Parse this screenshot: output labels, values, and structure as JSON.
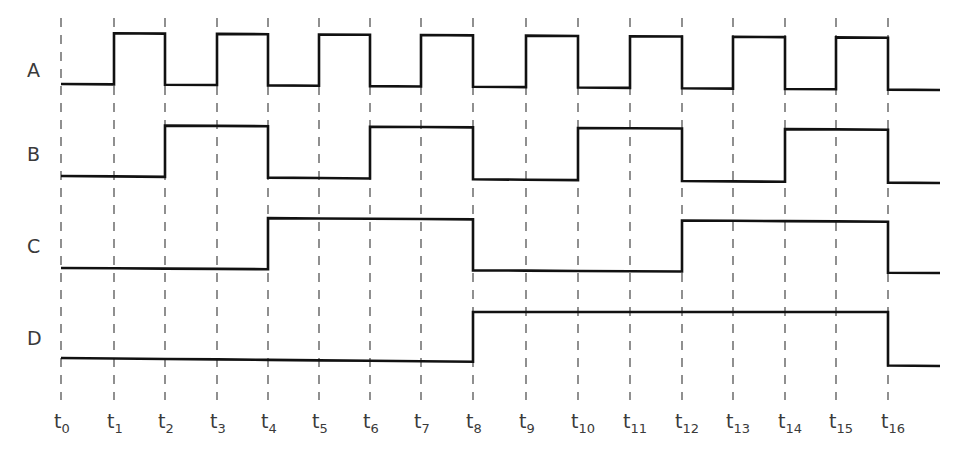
{
  "signals": [
    {
      "name": "A",
      "label_y": 84,
      "high_y": [
        33,
        38
      ],
      "low_y": [
        84,
        90
      ],
      "levels": [
        0,
        1,
        0,
        1,
        0,
        1,
        0,
        1,
        0,
        1,
        0,
        1,
        0,
        1,
        0,
        1,
        0
      ]
    },
    {
      "name": "B",
      "label_y": 168,
      "high_y": [
        125,
        130
      ],
      "low_y": [
        176,
        183
      ],
      "levels": [
        0,
        0,
        1,
        1,
        0,
        0,
        1,
        1,
        0,
        0,
        1,
        1,
        0,
        0,
        1,
        1,
        0
      ]
    },
    {
      "name": "C",
      "label_y": 260,
      "high_y": [
        217,
        222
      ],
      "low_y": [
        268,
        273
      ],
      "levels": [
        0,
        0,
        0,
        0,
        1,
        1,
        1,
        1,
        0,
        0,
        0,
        0,
        1,
        1,
        1,
        1,
        0
      ]
    },
    {
      "name": "D",
      "label_y": 352,
      "high_y": [
        312,
        312
      ],
      "low_y": [
        358,
        366
      ],
      "levels": [
        0,
        0,
        0,
        0,
        0,
        0,
        0,
        0,
        1,
        1,
        1,
        1,
        1,
        1,
        1,
        1,
        0
      ]
    }
  ],
  "time_markers": [
    {
      "base": "t",
      "sub": "0",
      "x": 61
    },
    {
      "base": "t",
      "sub": "1",
      "x": 114
    },
    {
      "base": "t",
      "sub": "2",
      "x": 165
    },
    {
      "base": "t",
      "sub": "3",
      "x": 217
    },
    {
      "base": "t",
      "sub": "4",
      "x": 268
    },
    {
      "base": "t",
      "sub": "5",
      "x": 319
    },
    {
      "base": "t",
      "sub": "6",
      "x": 370
    },
    {
      "base": "t",
      "sub": "7",
      "x": 421
    },
    {
      "base": "t",
      "sub": "8",
      "x": 473
    },
    {
      "base": "t",
      "sub": "9",
      "x": 526
    },
    {
      "base": "t",
      "sub": "10",
      "x": 578
    },
    {
      "base": "t",
      "sub": "11",
      "x": 630
    },
    {
      "base": "t",
      "sub": "12",
      "x": 682
    },
    {
      "base": "t",
      "sub": "13",
      "x": 733
    },
    {
      "base": "t",
      "sub": "14",
      "x": 785
    },
    {
      "base": "t",
      "sub": "15",
      "x": 836
    },
    {
      "base": "t",
      "sub": "16",
      "x": 888
    }
  ],
  "end_x": 940,
  "guide_top": 18,
  "guide_bottom": 400,
  "colors": {
    "wave": "#111111",
    "guide": "#555555",
    "text": "#3a3a3a"
  }
}
